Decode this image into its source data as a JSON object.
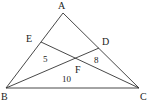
{
  "diagram": {
    "type": "geometry-triangle",
    "stroke_color": "#333333",
    "background": "#ffffff",
    "points": {
      "A": {
        "label": "A",
        "x": 63,
        "y": 13
      },
      "B": {
        "label": "B",
        "x": 6,
        "y": 88
      },
      "C": {
        "label": "C",
        "x": 139,
        "y": 88
      },
      "D": {
        "label": "D",
        "x": 99,
        "y": 48
      },
      "E": {
        "label": "E",
        "x": 41,
        "y": 42
      },
      "F": {
        "label": "F",
        "x": 77,
        "y": 58
      }
    },
    "segments": [
      "AB",
      "AC",
      "BC",
      "BD",
      "CE"
    ],
    "region_areas": [
      {
        "id": "BEF",
        "value": "5"
      },
      {
        "id": "CDF",
        "value": "8"
      },
      {
        "id": "BFC",
        "value": "10"
      }
    ]
  }
}
